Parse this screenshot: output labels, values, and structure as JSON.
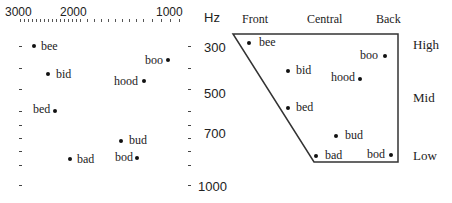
{
  "formant_plot": {
    "x_axis": {
      "ticks": [
        {
          "label": "3000",
          "x": 5
        },
        {
          "label": "2000",
          "x": 60
        },
        {
          "label": "1000",
          "x": 156
        }
      ],
      "unit_label": "Hz"
    },
    "y_axis": {
      "ticks": [
        {
          "label": "300",
          "y": 47
        },
        {
          "label": "500",
          "y": 93
        },
        {
          "label": "700",
          "y": 133
        },
        {
          "label": "1000",
          "y": 186
        }
      ]
    },
    "points": [
      {
        "word": "bee",
        "dot_x": 34,
        "dot_y": 46,
        "label_x": 41,
        "label_y": 39,
        "side": "right"
      },
      {
        "word": "bid",
        "dot_x": 48,
        "dot_y": 74,
        "label_x": 56,
        "label_y": 67,
        "side": "right"
      },
      {
        "word": "boo",
        "dot_x": 168,
        "dot_y": 60,
        "label_x": 145,
        "label_y": 53,
        "side": "left"
      },
      {
        "word": "hood",
        "dot_x": 144,
        "dot_y": 81,
        "label_x": 114,
        "label_y": 74,
        "side": "left"
      },
      {
        "word": "bed",
        "dot_x": 55,
        "dot_y": 111,
        "label_x": 33,
        "label_y": 102,
        "side": "left"
      },
      {
        "word": "bud",
        "dot_x": 121,
        "dot_y": 141,
        "label_x": 129,
        "label_y": 133,
        "side": "right"
      },
      {
        "word": "bad",
        "dot_x": 70,
        "dot_y": 159,
        "label_x": 77,
        "label_y": 152,
        "side": "right"
      },
      {
        "word": "bod",
        "dot_x": 137,
        "dot_y": 158,
        "label_x": 115,
        "label_y": 150,
        "side": "left"
      }
    ]
  },
  "vowel_chart": {
    "column_labels": [
      {
        "label": "Front",
        "x": 242
      },
      {
        "label": "Central",
        "x": 307
      },
      {
        "label": "Back",
        "x": 376
      }
    ],
    "row_labels": [
      {
        "label": "High",
        "y": 37
      },
      {
        "label": "Mid",
        "y": 90
      },
      {
        "label": "Low",
        "y": 148
      }
    ],
    "points": [
      {
        "word": "bee",
        "dot_x": 249,
        "dot_y": 43,
        "label_x": 259,
        "label_y": 35,
        "side": "right"
      },
      {
        "word": "bid",
        "dot_x": 288,
        "dot_y": 71,
        "label_x": 296,
        "label_y": 63,
        "side": "right"
      },
      {
        "word": "boo",
        "dot_x": 385,
        "dot_y": 56,
        "label_x": 360,
        "label_y": 48,
        "side": "left"
      },
      {
        "word": "hood",
        "dot_x": 360,
        "dot_y": 79,
        "label_x": 331,
        "label_y": 70,
        "side": "left"
      },
      {
        "word": "bed",
        "dot_x": 288,
        "dot_y": 108,
        "label_x": 296,
        "label_y": 100,
        "side": "right"
      },
      {
        "word": "bud",
        "dot_x": 336,
        "dot_y": 136,
        "label_x": 345,
        "label_y": 128,
        "side": "right"
      },
      {
        "word": "bad",
        "dot_x": 316,
        "dot_y": 156,
        "label_x": 325,
        "label_y": 148,
        "side": "right"
      },
      {
        "word": "bod",
        "dot_x": 391,
        "dot_y": 155,
        "label_x": 367,
        "label_y": 147,
        "side": "left"
      }
    ],
    "quadrilateral": {
      "top_left": [
        233,
        34
      ],
      "top_right": [
        398,
        34
      ],
      "bottom_right": [
        398,
        162
      ],
      "bottom_left": [
        314,
        162
      ],
      "stroke": "#333333"
    }
  }
}
